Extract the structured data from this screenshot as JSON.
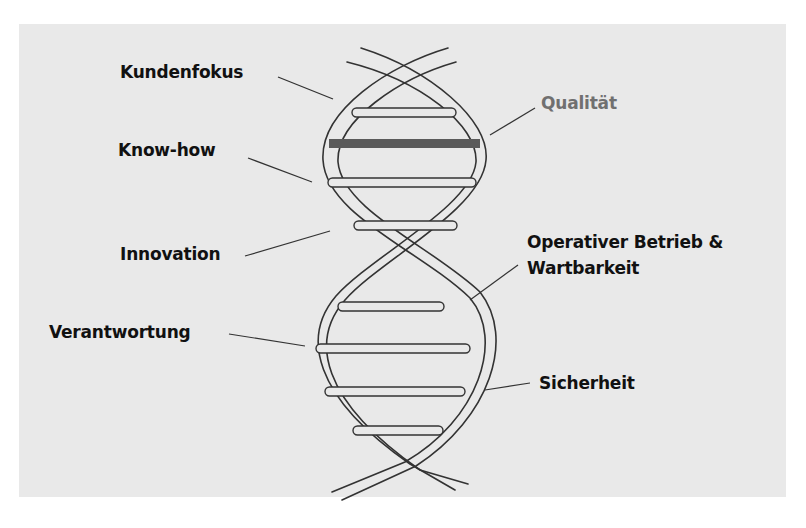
{
  "diagram": {
    "type": "dna-helix",
    "labels": {
      "kundenfokus": "Kundenfokus",
      "qualitaet": "Qualität",
      "know_how": "Know-how",
      "innovation": "Innovation",
      "operativ_line1": "Operativer Betrieb &",
      "operativ_line2": "Wartbarkeit",
      "verantwortung": "Verantwortung",
      "sicherheit": "Sicherheit"
    },
    "highlighted": "Qualität"
  },
  "colors": {
    "background": "#e9e9e9",
    "text": "#111111",
    "muted_text": "#707070",
    "strand": "#333333",
    "highlight_rung": "#5a5a5a"
  }
}
